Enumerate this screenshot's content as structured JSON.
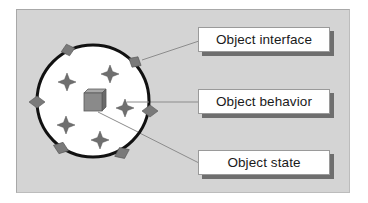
{
  "diagram": {
    "title": "",
    "labels": {
      "interface": "Object interface",
      "behavior": "Object behavior",
      "state": "Object state"
    },
    "colors": {
      "panel_background": "#d4d4d4",
      "circle_fill": "#ffffff",
      "circle_stroke": "#111111",
      "diamond_fill": "#7a7a7a",
      "star_fill": "#6f6f6f",
      "cube_fill": "#8a8a8a",
      "connector_line": "#8c8c8c",
      "label_shadow": "#6e6e6e"
    },
    "circle": {
      "cx": 93,
      "cy": 101,
      "r": 56
    },
    "interface_diamonds": [
      {
        "x": 68,
        "y": 50
      },
      {
        "x": 135,
        "y": 62
      },
      {
        "x": 37,
        "y": 102
      },
      {
        "x": 150,
        "y": 111
      },
      {
        "x": 61,
        "y": 148
      },
      {
        "x": 122,
        "y": 153
      }
    ],
    "behavior_stars": [
      {
        "x": 67,
        "y": 82
      },
      {
        "x": 110,
        "y": 74
      },
      {
        "x": 125,
        "y": 108
      },
      {
        "x": 66,
        "y": 125
      },
      {
        "x": 100,
        "y": 140
      }
    ],
    "state_cube": {
      "x": 84,
      "y": 90,
      "size": 18,
      "depth": 4
    },
    "connectors": [
      {
        "target": "interface",
        "from": [
          142,
          60
        ],
        "to": [
          199,
          41
        ]
      },
      {
        "target": "behavior",
        "from": [
          127,
          102
        ],
        "to": [
          199,
          102
        ]
      },
      {
        "target": "state",
        "from": [
          98,
          112
        ],
        "to": [
          199,
          163
        ]
      }
    ]
  }
}
